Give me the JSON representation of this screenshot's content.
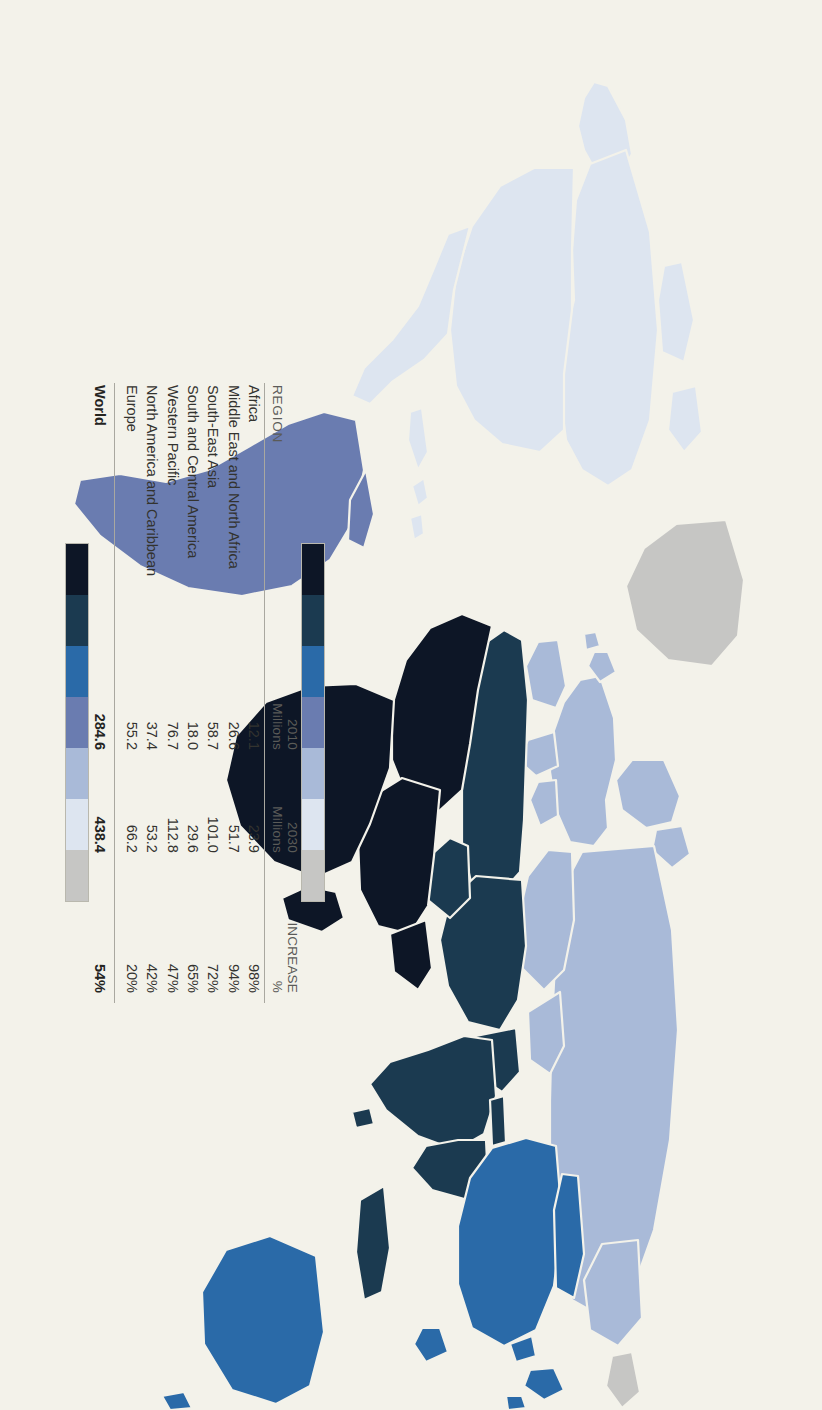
{
  "document": {
    "kind": "world-map-infographic",
    "orientation": "rotated-90-clockwise",
    "paper_color": "#f3f2ea"
  },
  "legend": {
    "headers": {
      "region": "REGION",
      "col_2010_line1": "2010",
      "col_2010_line2": "Millions",
      "col_2030_line1": "2030",
      "col_2030_line2": "Millions",
      "col_increase_line1": "INCREASE",
      "col_increase_line2": "%"
    },
    "rows": [
      {
        "region": "Africa",
        "v2010": "12.1",
        "v2030": "23.9",
        "increase": "98%",
        "color": "#0d1626"
      },
      {
        "region": "Middle East and North Africa",
        "v2010": "26.6",
        "v2030": "51.7",
        "increase": "94%",
        "color": "#1b3a50"
      },
      {
        "region": "South-East Asia",
        "v2010": "58.7",
        "v2030": "101.0",
        "increase": "72%",
        "color": "#2a6aa8"
      },
      {
        "region": "South and Central America",
        "v2010": "18.0",
        "v2030": "29.6",
        "increase": "65%",
        "color": "#6a7cb0"
      },
      {
        "region": "Western Pacific",
        "v2010": "76.7",
        "v2030": "112.8",
        "increase": "47%",
        "color": "#a9bad8"
      },
      {
        "region": "North America and Caribbean",
        "v2010": "37.4",
        "v2030": "53.2",
        "increase": "42%",
        "color": "#dde5f0"
      },
      {
        "region": "Europe",
        "v2010": "55.2",
        "v2030": "66.2",
        "increase": "20%",
        "color": "#c6c6c4"
      }
    ],
    "total": {
      "region": "World",
      "v2010": "284.6",
      "v2030": "438.4",
      "increase": "54%"
    }
  },
  "map": {
    "no_data_color": "#c6c6c4",
    "border_color": "#f3f2ea",
    "ocean_color": "#f3f2ea",
    "regions": [
      {
        "name": "Africa",
        "color": "#0d1626"
      },
      {
        "name": "Middle East and North Africa",
        "color": "#1b3a50"
      },
      {
        "name": "South-East Asia",
        "color": "#1b3a50"
      },
      {
        "name": "Western Pacific",
        "color": "#2a6aa8"
      },
      {
        "name": "South and Central America",
        "color": "#6a7cb0"
      },
      {
        "name": "Europe",
        "color": "#a9bad8"
      },
      {
        "name": "North America and Caribbean",
        "color": "#dde5f0"
      },
      {
        "name": "No data",
        "color": "#c6c6c4"
      }
    ]
  },
  "chart_data": {
    "type": "table",
    "categories": [
      "Africa",
      "Middle East and North Africa",
      "South-East Asia",
      "South and Central America",
      "Western Pacific",
      "North America and Caribbean",
      "Europe"
    ],
    "series": [
      {
        "name": "2010 Millions",
        "values": [
          12.1,
          26.6,
          58.7,
          18.0,
          76.7,
          37.4,
          55.2
        ]
      },
      {
        "name": "2030 Millions",
        "values": [
          23.9,
          51.7,
          101.0,
          29.6,
          112.8,
          53.2,
          66.2
        ]
      },
      {
        "name": "Increase %",
        "values": [
          98,
          94,
          72,
          65,
          47,
          42,
          20
        ]
      }
    ],
    "totals": {
      "2010": 284.6,
      "2030": 438.4,
      "increase_pct": 54
    },
    "colors": [
      "#0d1626",
      "#1b3a50",
      "#2a6aa8",
      "#6a7cb0",
      "#a9bad8",
      "#dde5f0",
      "#c6c6c4"
    ],
    "xlabel": "",
    "ylabel": "",
    "legend_position": "inline-table"
  }
}
